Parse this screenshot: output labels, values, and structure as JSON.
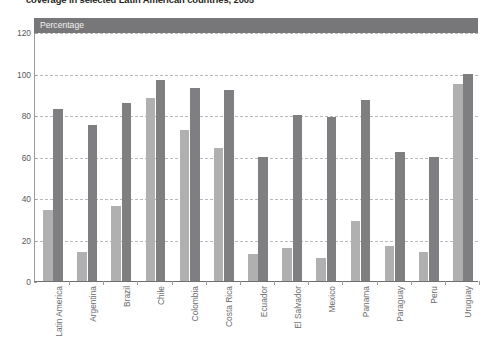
{
  "chart_title": "coverage in selected Latin American countries, 2005",
  "axis_band": {
    "label": "Percentage"
  },
  "chart_data": {
    "type": "bar",
    "title": "coverage in selected Latin American countries, 2005",
    "subtitle": "",
    "xlabel": "",
    "ylabel": "Percentage",
    "ylim": [
      0,
      120
    ],
    "yticks": [
      0,
      20,
      40,
      60,
      80,
      100,
      120
    ],
    "grid": true,
    "legend": "none",
    "grouped": true,
    "categories": [
      "Latin America",
      "Argentina",
      "Brazil",
      "Chile",
      "Colombia",
      "Costa Rica",
      "Ecuador",
      "El Salvador",
      "Mexico",
      "Panama",
      "Paraguay",
      "Peru",
      "Uruguay"
    ],
    "series": [
      {
        "name": "Series 1",
        "color": "#b0b0b0",
        "values": [
          34,
          14,
          36,
          88,
          73,
          64,
          13,
          16,
          11,
          29,
          17,
          14,
          95
        ]
      },
      {
        "name": "Series 2",
        "color": "#7f7f82",
        "values": [
          83,
          75,
          86,
          97,
          93,
          92,
          60,
          80,
          79,
          87,
          62,
          60,
          100
        ]
      }
    ]
  }
}
